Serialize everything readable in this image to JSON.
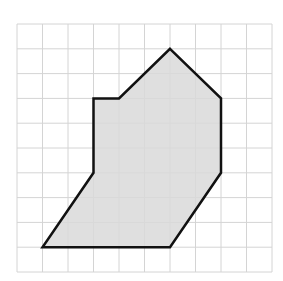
{
  "figure": {
    "grid": {
      "columns": 10,
      "rows": 10,
      "origin_px": [
        17,
        24
      ],
      "cell_w_px": 25.5,
      "cell_h_px": 24.8,
      "line_color": "#d4d4d4"
    },
    "polygon": {
      "vertices_grid": [
        [
          6,
          1
        ],
        [
          8,
          3
        ],
        [
          8,
          6
        ],
        [
          6,
          9
        ],
        [
          1,
          9
        ],
        [
          3,
          6
        ],
        [
          3,
          3
        ],
        [
          4,
          3
        ]
      ],
      "fill_color": "#d9d9d9",
      "stroke_color": "#111111",
      "stroke_width": 2.5
    }
  }
}
